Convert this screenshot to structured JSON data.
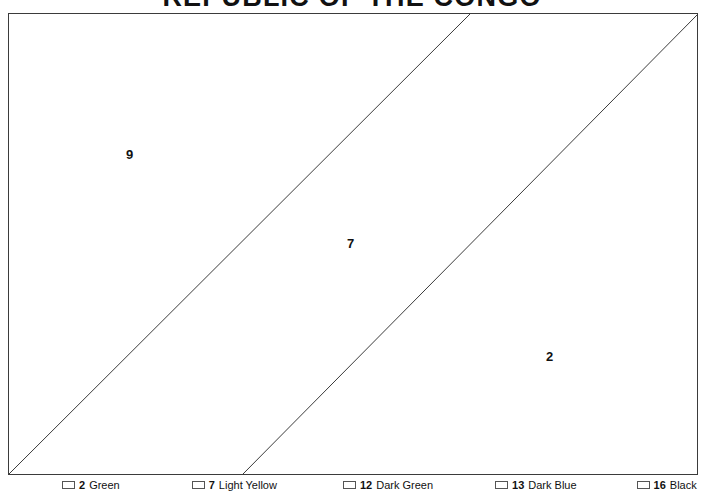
{
  "title": "REPUBLIC OF THE CONGO",
  "flag": {
    "frame": {
      "x": 8,
      "y": 13,
      "width": 690,
      "height": 462,
      "stroke": "#3b3b3b"
    },
    "regions": [
      {
        "id": "upper-hoist",
        "number": "9",
        "label_x": 125,
        "label_y": 147
      },
      {
        "id": "diagonal-band",
        "number": "7",
        "label_x": 346,
        "label_y": 236
      },
      {
        "id": "lower-fly",
        "number": "2",
        "label_x": 545,
        "label_y": 349
      }
    ],
    "diagonals": [
      {
        "id": "diagonal-upper",
        "x1": 0,
        "y1": 460,
        "x2": 461,
        "y2": 0
      },
      {
        "id": "diagonal-lower",
        "x1": 234,
        "y1": 460,
        "x2": 689,
        "y2": 0
      }
    ]
  },
  "legend": {
    "items": [
      {
        "number": "2",
        "name": "Green",
        "color": "#1f7a3a"
      },
      {
        "number": "7",
        "name": "Light Yellow",
        "color": "#f4e04a"
      },
      {
        "number": "12",
        "name": "Dark Green",
        "color": "#14532d"
      },
      {
        "number": "13",
        "name": "Dark Blue",
        "color": "#17306b"
      },
      {
        "number": "16",
        "name": "Black",
        "color": "#111111"
      }
    ]
  }
}
